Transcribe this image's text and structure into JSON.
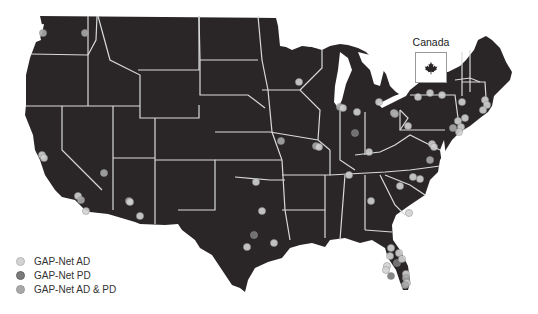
{
  "map": {
    "land_color": "#2a2627",
    "border_color": "#d9d9d9",
    "background": "#ffffff"
  },
  "inset": {
    "label": "Canada",
    "icon": "maple-leaf-icon"
  },
  "legend": {
    "items": [
      {
        "label": "GAP-Net AD",
        "color": "#d3d3d3"
      },
      {
        "label": "GAP-Net PD",
        "color": "#7a7a7a"
      },
      {
        "label": "GAP-Net AD & PD",
        "color": "#a9a9a9"
      }
    ]
  },
  "sites": [
    {
      "x": 43,
      "y": 33,
      "type": "AD & PD"
    },
    {
      "x": 85,
      "y": 33,
      "type": "AD & PD"
    },
    {
      "x": 42,
      "y": 155,
      "type": "AD"
    },
    {
      "x": 44,
      "y": 158,
      "type": "AD"
    },
    {
      "x": 104,
      "y": 173,
      "type": "AD & PD"
    },
    {
      "x": 78,
      "y": 196,
      "type": "AD"
    },
    {
      "x": 81,
      "y": 200,
      "type": "AD & PD"
    },
    {
      "x": 86,
      "y": 211,
      "type": "AD"
    },
    {
      "x": 129,
      "y": 201,
      "type": "AD & PD"
    },
    {
      "x": 130,
      "y": 202,
      "type": "AD"
    },
    {
      "x": 140,
      "y": 216,
      "type": "AD"
    },
    {
      "x": 256,
      "y": 182,
      "type": "AD"
    },
    {
      "x": 262,
      "y": 211,
      "type": "AD"
    },
    {
      "x": 254,
      "y": 235,
      "type": "PD"
    },
    {
      "x": 247,
      "y": 247,
      "type": "AD"
    },
    {
      "x": 274,
      "y": 243,
      "type": "AD"
    },
    {
      "x": 299,
      "y": 82,
      "type": "AD"
    },
    {
      "x": 340,
      "y": 107,
      "type": "AD & PD"
    },
    {
      "x": 343,
      "y": 108,
      "type": "AD"
    },
    {
      "x": 357,
      "y": 112,
      "type": "AD"
    },
    {
      "x": 379,
      "y": 102,
      "type": "AD"
    },
    {
      "x": 355,
      "y": 133,
      "type": "PD"
    },
    {
      "x": 281,
      "y": 141,
      "type": "AD & PD"
    },
    {
      "x": 316,
      "y": 146,
      "type": "AD & PD"
    },
    {
      "x": 319,
      "y": 147,
      "type": "AD"
    },
    {
      "x": 369,
      "y": 152,
      "type": "AD"
    },
    {
      "x": 394,
      "y": 113,
      "type": "AD"
    },
    {
      "x": 395,
      "y": 114,
      "type": "AD & PD"
    },
    {
      "x": 408,
      "y": 126,
      "type": "AD"
    },
    {
      "x": 418,
      "y": 97,
      "type": "AD"
    },
    {
      "x": 430,
      "y": 93,
      "type": "AD"
    },
    {
      "x": 442,
      "y": 95,
      "type": "AD"
    },
    {
      "x": 462,
      "y": 102,
      "type": "AD"
    },
    {
      "x": 485,
      "y": 100,
      "type": "AD"
    },
    {
      "x": 487,
      "y": 105,
      "type": "AD"
    },
    {
      "x": 483,
      "y": 110,
      "type": "AD"
    },
    {
      "x": 465,
      "y": 118,
      "type": "AD"
    },
    {
      "x": 458,
      "y": 121,
      "type": "AD"
    },
    {
      "x": 453,
      "y": 128,
      "type": "AD & PD"
    },
    {
      "x": 461,
      "y": 127,
      "type": "AD"
    },
    {
      "x": 459,
      "y": 132,
      "type": "AD"
    },
    {
      "x": 432,
      "y": 144,
      "type": "AD"
    },
    {
      "x": 434,
      "y": 147,
      "type": "AD"
    },
    {
      "x": 430,
      "y": 160,
      "type": "AD & PD"
    },
    {
      "x": 349,
      "y": 175,
      "type": "AD"
    },
    {
      "x": 413,
      "y": 177,
      "type": "AD"
    },
    {
      "x": 420,
      "y": 179,
      "type": "AD"
    },
    {
      "x": 400,
      "y": 186,
      "type": "AD"
    },
    {
      "x": 371,
      "y": 201,
      "type": "AD"
    },
    {
      "x": 409,
      "y": 213,
      "type": "AD"
    },
    {
      "x": 391,
      "y": 248,
      "type": "AD"
    },
    {
      "x": 399,
      "y": 253,
      "type": "AD"
    },
    {
      "x": 390,
      "y": 256,
      "type": "AD"
    },
    {
      "x": 397,
      "y": 263,
      "type": "PD"
    },
    {
      "x": 402,
      "y": 259,
      "type": "AD"
    },
    {
      "x": 387,
      "y": 266,
      "type": "AD"
    },
    {
      "x": 386,
      "y": 270,
      "type": "AD"
    },
    {
      "x": 391,
      "y": 276,
      "type": "PD"
    },
    {
      "x": 406,
      "y": 274,
      "type": "AD"
    },
    {
      "x": 406,
      "y": 278,
      "type": "AD & PD"
    },
    {
      "x": 407,
      "y": 283,
      "type": "AD"
    },
    {
      "x": 405,
      "y": 285,
      "type": "AD & PD"
    }
  ]
}
